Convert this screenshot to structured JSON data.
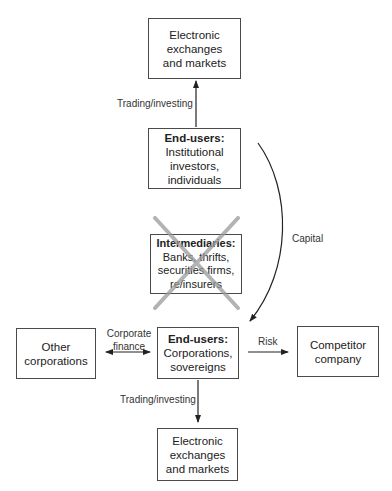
{
  "diagram": {
    "nodes": {
      "top_exchanges": {
        "lines": [
          "Electronic",
          "exchanges",
          "and markets"
        ]
      },
      "end_users_investors": {
        "title": "End-users:",
        "lines": [
          "Institutional",
          "investors,",
          "individuals"
        ]
      },
      "intermediaries": {
        "title": "Intermediaries:",
        "lines": [
          "Banks, thrifts,",
          "securities firms,",
          "re/insurers"
        ],
        "crossed_out": true
      },
      "other_corporations": {
        "lines": [
          "Other",
          "corporations"
        ]
      },
      "end_users_corporations": {
        "title": "End-users:",
        "lines": [
          "Corporations,",
          "sovereigns"
        ]
      },
      "competitor": {
        "lines": [
          "Competitor",
          "company"
        ]
      },
      "bottom_exchanges": {
        "lines": [
          "Electronic",
          "exchanges",
          "and markets"
        ]
      }
    },
    "edges": {
      "trading_up": {
        "label": "Trading/investing"
      },
      "capital": {
        "label": "Capital"
      },
      "corporate_finance": {
        "label_line1": "Corporate",
        "label_line2": "finance"
      },
      "risk": {
        "label": "Risk"
      },
      "trading_down": {
        "label": "Trading/investing"
      }
    },
    "colors": {
      "line": "#222222",
      "cross": "#9a9a9a",
      "border": "#4a4a4a"
    }
  }
}
